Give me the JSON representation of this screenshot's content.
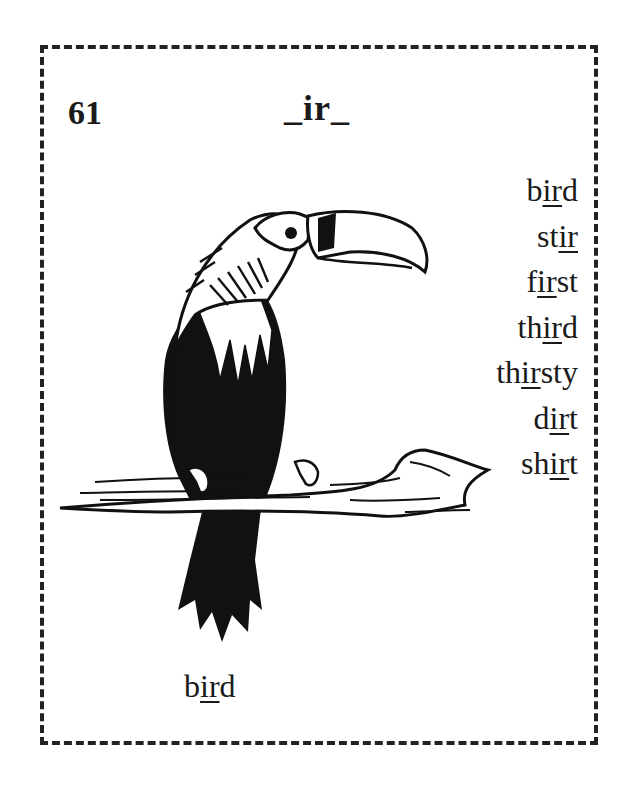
{
  "card": {
    "number": "61",
    "pattern": "_ir_",
    "words": [
      {
        "pre": "b",
        "mid": "ir",
        "post": "d"
      },
      {
        "pre": "st",
        "mid": "ir",
        "post": ""
      },
      {
        "pre": "f",
        "mid": "ir",
        "post": "st"
      },
      {
        "pre": "th",
        "mid": "ir",
        "post": "d"
      },
      {
        "pre": "th",
        "mid": "ir",
        "post": "sty"
      },
      {
        "pre": "d",
        "mid": "ir",
        "post": "t"
      },
      {
        "pre": "sh",
        "mid": "ir",
        "post": "t"
      }
    ],
    "caption": {
      "pre": "b",
      "mid": "ir",
      "post": "d"
    },
    "illustration": "toucan-on-branch"
  }
}
